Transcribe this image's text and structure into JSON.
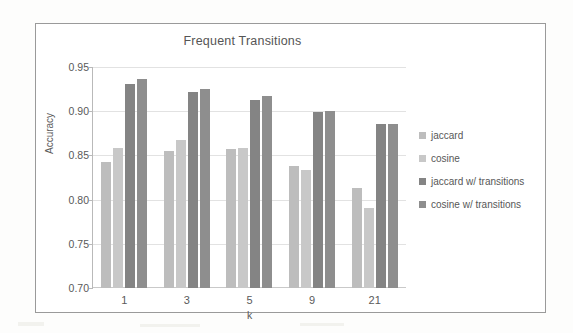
{
  "chart_data": {
    "type": "bar",
    "title": "Frequent Transitions",
    "xlabel": "k",
    "ylabel": "Accuracy",
    "categories": [
      "1",
      "3",
      "5",
      "9",
      "21"
    ],
    "ylim": [
      0.7,
      0.95
    ],
    "yticks": [
      "0.95",
      "0.90",
      "0.85",
      "0.80",
      "0.75",
      "0.70"
    ],
    "ytick_values": [
      0.95,
      0.9,
      0.85,
      0.8,
      0.75,
      0.7
    ],
    "grid": true,
    "legend_position": "right",
    "series": [
      {
        "name": "jaccard",
        "color": "#bdbdbd",
        "values": [
          0.842,
          0.855,
          0.857,
          0.838,
          0.813
        ]
      },
      {
        "name": "cosine",
        "color": "#c8c8c8",
        "values": [
          0.858,
          0.867,
          0.858,
          0.833,
          0.791
        ]
      },
      {
        "name": "jaccard w/ transitions",
        "color": "#848484",
        "values": [
          0.931,
          0.922,
          0.913,
          0.899,
          0.885
        ]
      },
      {
        "name": "cosine w/ transitions",
        "color": "#8e8e8e",
        "values": [
          0.936,
          0.925,
          0.917,
          0.9,
          0.885
        ]
      }
    ]
  }
}
